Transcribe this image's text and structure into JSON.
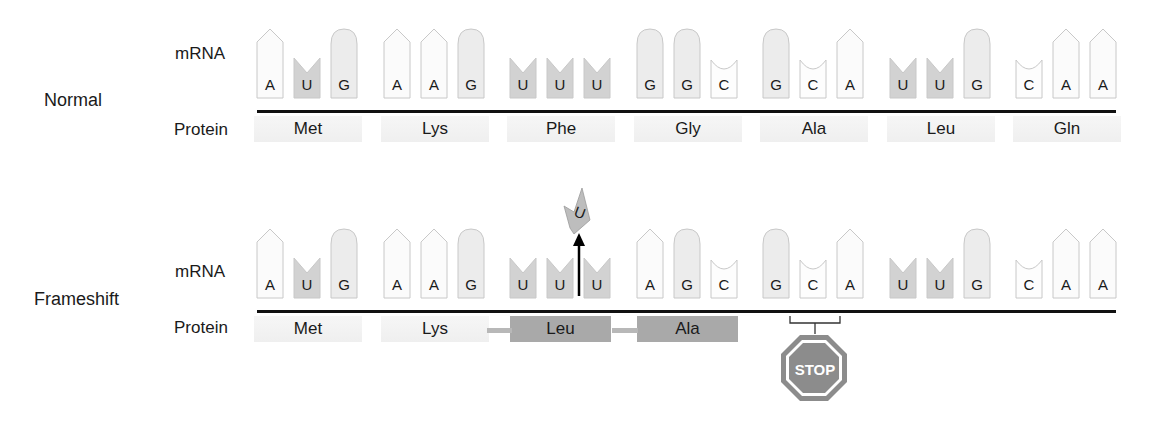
{
  "colors": {
    "A_fill": "#fbfbfb",
    "U_fill": "#d2d2d2",
    "G_fill": "#ececec",
    "C_fill": "#fdfdfd",
    "outline": "#c8c8c8",
    "line": "#111111",
    "aa_box": "#a9a9a9",
    "stop_fill": "#8c8c8c"
  },
  "rows": [
    {
      "label": "Normal",
      "mrna_label": "mRNA",
      "protein_label": "Protein",
      "codons": [
        {
          "bases": [
            "A",
            "U",
            "G"
          ],
          "amino_acid": "Met",
          "style": "faint"
        },
        {
          "bases": [
            "A",
            "A",
            "G"
          ],
          "amino_acid": "Lys",
          "style": "faint"
        },
        {
          "bases": [
            "U",
            "U",
            "U"
          ],
          "amino_acid": "Phe",
          "style": "faint"
        },
        {
          "bases": [
            "G",
            "G",
            "C"
          ],
          "amino_acid": "Gly",
          "style": "faint"
        },
        {
          "bases": [
            "G",
            "C",
            "A"
          ],
          "amino_acid": "Ala",
          "style": "faint"
        },
        {
          "bases": [
            "U",
            "U",
            "G"
          ],
          "amino_acid": "Leu",
          "style": "faint"
        },
        {
          "bases": [
            "C",
            "A",
            "A"
          ],
          "amino_acid": "Gln",
          "style": "faint"
        }
      ]
    },
    {
      "label": "Frameshift",
      "mrna_label": "mRNA",
      "protein_label": "Protein",
      "codons": [
        {
          "bases": [
            "A",
            "U",
            "G"
          ],
          "amino_acid": "Met",
          "style": "faint"
        },
        {
          "bases": [
            "A",
            "A",
            "G"
          ],
          "amino_acid": "Lys",
          "style": "faint"
        },
        {
          "bases": [
            "U",
            "U",
            "U"
          ],
          "amino_acid": "Leu",
          "style": "box"
        },
        {
          "bases": [
            "A",
            "G",
            "C"
          ],
          "amino_acid": "Ala",
          "style": "box"
        },
        {
          "bases": [
            "G",
            "C",
            "A"
          ],
          "amino_acid": "",
          "style": "none"
        },
        {
          "bases": [
            "U",
            "U",
            "G"
          ],
          "amino_acid": "",
          "style": "none"
        },
        {
          "bases": [
            "C",
            "A",
            "A"
          ],
          "amino_acid": "",
          "style": "none"
        }
      ],
      "inserted_base": "U",
      "stop_label": "STOP"
    }
  ]
}
